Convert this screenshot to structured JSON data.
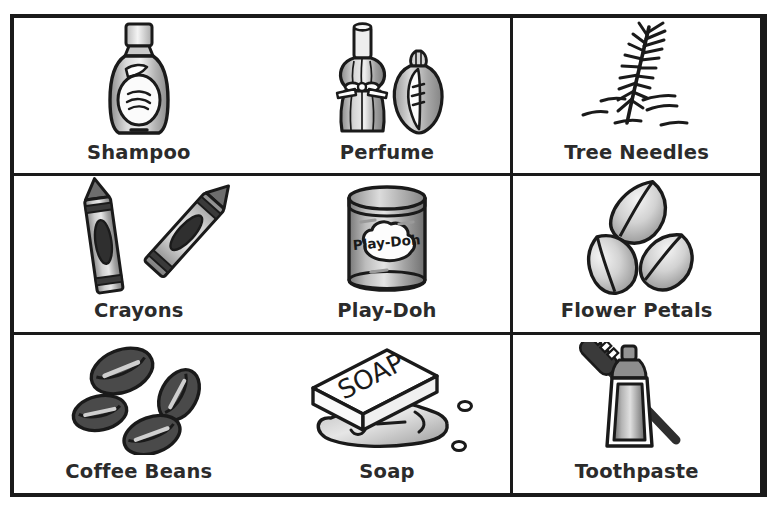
{
  "page": {
    "background_color": "#ffffff",
    "frame_color": "#1a1a1a",
    "text_color": "#2b2b2b"
  },
  "grid": {
    "rows": 3,
    "columns": 3,
    "cells": [
      {
        "id": "shampoo",
        "label": "Shampoo",
        "icon": "shampoo-bottle-illustration"
      },
      {
        "id": "perfume",
        "label": "Perfume",
        "icon": "perfume-bottles-illustration"
      },
      {
        "id": "tree-needles",
        "label": "Tree Needles",
        "icon": "pine-branch-needles-illustration"
      },
      {
        "id": "crayons",
        "label": "Crayons",
        "icon": "two-crayons-illustration"
      },
      {
        "id": "play-doh",
        "label": "Play-Doh",
        "icon": "play-doh-can-illustration"
      },
      {
        "id": "flower-petals",
        "label": "Flower Petals",
        "icon": "three-petals-illustration"
      },
      {
        "id": "coffee-beans",
        "label": "Coffee Beans",
        "icon": "four-coffee-beans-illustration"
      },
      {
        "id": "soap",
        "label": "Soap",
        "icon": "soap-bar-puddle-illustration"
      },
      {
        "id": "toothpaste",
        "label": "Toothpaste",
        "icon": "toothpaste-tube-brush-illustration"
      }
    ]
  },
  "artwork_text": {
    "play_doh_can_label": "Play-Doh",
    "soap_bar_label": "SOAP"
  }
}
